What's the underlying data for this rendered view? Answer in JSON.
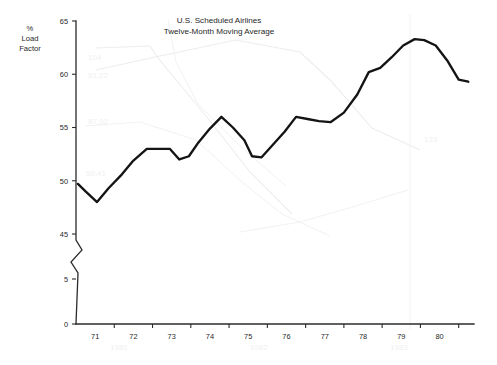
{
  "chart_data": {
    "type": "line",
    "title": "U.S. Scheduled Airlines",
    "subtitle": "Twelve-Month Moving Average",
    "ylabel_lines": [
      "%",
      "Load",
      "Factor"
    ],
    "xlabel": "",
    "ytick_labels": [
      "0",
      "5",
      "45",
      "50",
      "55",
      "60",
      "65"
    ],
    "ytick_values": [
      0,
      5,
      45,
      50,
      55,
      60,
      65
    ],
    "axis_break": true,
    "axis_break_between": [
      5,
      45
    ],
    "xtick_labels": [
      "71",
      "72",
      "73",
      "74",
      "75",
      "76",
      "77",
      "78",
      "79",
      "80"
    ],
    "xtick_values": [
      71,
      72,
      73,
      74,
      75,
      76,
      77,
      78,
      79,
      80
    ],
    "xlim": [
      70.5,
      80.9
    ],
    "ylim_upper": [
      45,
      65
    ],
    "grid": false,
    "legend": null,
    "series": [
      {
        "name": "Load Factor",
        "x": [
          70.55,
          70.75,
          71.05,
          71.35,
          71.7,
          72.0,
          72.35,
          72.6,
          72.95,
          73.2,
          73.45,
          73.7,
          74.0,
          74.3,
          74.6,
          74.9,
          75.1,
          75.35,
          75.65,
          75.95,
          76.25,
          76.55,
          76.85,
          77.15,
          77.5,
          77.85,
          78.15,
          78.45,
          78.75,
          79.05,
          79.35,
          79.6,
          79.9,
          80.2,
          80.5,
          80.75
        ],
        "y": [
          49.7,
          49.0,
          48.0,
          49.3,
          50.6,
          51.9,
          53.0,
          53.0,
          53.0,
          52.0,
          52.3,
          53.6,
          54.9,
          56.0,
          55.0,
          53.8,
          52.3,
          52.2,
          53.4,
          54.6,
          56.0,
          55.8,
          55.6,
          55.5,
          56.4,
          58.1,
          60.2,
          60.6,
          61.6,
          62.7,
          63.3,
          63.2,
          62.7,
          61.3,
          59.5,
          59.3
        ]
      }
    ],
    "series_color": "#141414"
  },
  "colors": {
    "axis": "#2b2b2b",
    "line": "#141414",
    "background": "#ffffff",
    "ghost": "#ededed"
  }
}
